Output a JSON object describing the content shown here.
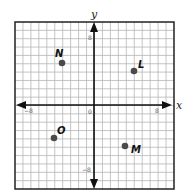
{
  "chart_data": {
    "type": "scatter",
    "title": "",
    "xlabel": "x",
    "ylabel": "y",
    "xlim": [
      -10,
      10
    ],
    "ylim": [
      -10,
      10
    ],
    "grid": true,
    "tick_labels": {
      "x_neg": "−8",
      "x_pos": "8",
      "y_pos": "8",
      "y_neg": "−8",
      "origin": "0"
    },
    "points": [
      {
        "label": "N",
        "x": -4,
        "y": 5
      },
      {
        "label": "L",
        "x": 5,
        "y": 4
      },
      {
        "label": "O",
        "x": -5,
        "y": -4
      },
      {
        "label": "M",
        "x": 4,
        "y": -5
      }
    ]
  },
  "axes": {
    "x_label": "x",
    "y_label": "y",
    "origin_label": "0",
    "x_neg_tick": "−8",
    "x_pos_tick": "8",
    "y_pos_tick": "8",
    "y_neg_tick": "−8"
  },
  "points": {
    "N": {
      "label": "N"
    },
    "L": {
      "label": "L"
    },
    "O": {
      "label": "O"
    },
    "M": {
      "label": "M"
    }
  },
  "colors": {
    "grid": "#b5b5b5",
    "axis": "#111111",
    "point": "#4a4a4a",
    "border": "#222222"
  }
}
